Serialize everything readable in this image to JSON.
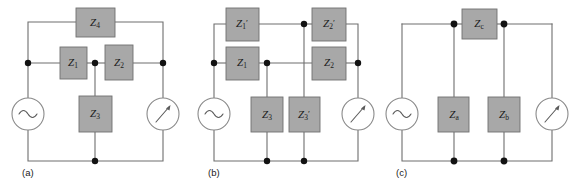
{
  "figure": {
    "panel_count": 3,
    "colors": {
      "impedance_box_fill": "#a8a8a8",
      "impedance_box_stroke": "#707070",
      "wire": "#6e6e6e",
      "node": "#121212",
      "device_outline": "#8a8a8a",
      "background": "#ffffff",
      "text": "#1a1a1a"
    }
  },
  "panels": [
    {
      "id": "a",
      "caption": "(a)",
      "source_label": "ac-source",
      "meter_label": "meter",
      "impedances": [
        {
          "name": "Z4",
          "base": "Z",
          "sub": "4",
          "prime": ""
        },
        {
          "name": "Z1",
          "base": "Z",
          "sub": "1",
          "prime": ""
        },
        {
          "name": "Z2",
          "base": "Z",
          "sub": "2",
          "prime": ""
        },
        {
          "name": "Z3",
          "base": "Z",
          "sub": "3",
          "prime": ""
        }
      ]
    },
    {
      "id": "b",
      "caption": "(b)",
      "source_label": "ac-source",
      "meter_label": "meter",
      "impedances": [
        {
          "name": "Z1prime",
          "base": "Z",
          "sub": "1",
          "prime": "′"
        },
        {
          "name": "Z2prime",
          "base": "Z",
          "sub": "2",
          "prime": "′"
        },
        {
          "name": "Z1",
          "base": "Z",
          "sub": "1",
          "prime": ""
        },
        {
          "name": "Z2",
          "base": "Z",
          "sub": "2",
          "prime": ""
        },
        {
          "name": "Z3",
          "base": "Z",
          "sub": "3",
          "prime": ""
        },
        {
          "name": "Z3prime",
          "base": "Z",
          "sub": "3",
          "prime": "′"
        }
      ]
    },
    {
      "id": "c",
      "caption": "(c)",
      "source_label": "ac-source",
      "meter_label": "meter",
      "impedances": [
        {
          "name": "Zc",
          "base": "Z",
          "sub": "c",
          "prime": ""
        },
        {
          "name": "Za",
          "base": "Z",
          "sub": "a",
          "prime": ""
        },
        {
          "name": "Zb",
          "base": "Z",
          "sub": "b",
          "prime": ""
        }
      ]
    }
  ],
  "labels": {
    "a_Z4_base": "Z",
    "a_Z4_sub": "4",
    "a_Z1_base": "Z",
    "a_Z1_sub": "1",
    "a_Z2_base": "Z",
    "a_Z2_sub": "2",
    "a_Z3_base": "Z",
    "a_Z3_sub": "3",
    "a_caption": "(a)",
    "b_Z1p_base": "Z",
    "b_Z1p_sub": "1",
    "b_Z1p_prime": "′",
    "b_Z2p_base": "Z",
    "b_Z2p_sub": "2",
    "b_Z2p_prime": "′",
    "b_Z1_base": "Z",
    "b_Z1_sub": "1",
    "b_Z2_base": "Z",
    "b_Z2_sub": "2",
    "b_Z3_base": "Z",
    "b_Z3_sub": "3",
    "b_Z3p_base": "Z",
    "b_Z3p_sub": "3",
    "b_Z3p_prime": "′",
    "b_caption": "(b)",
    "c_Zc_base": "Z",
    "c_Zc_sub": "c",
    "c_Za_base": "Z",
    "c_Za_sub": "a",
    "c_Zb_base": "Z",
    "c_Zb_sub": "b",
    "c_caption": "(c)"
  }
}
